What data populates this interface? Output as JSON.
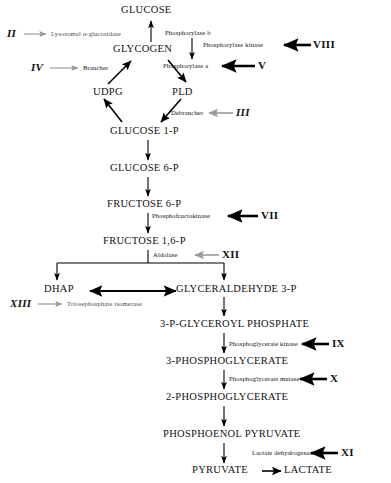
{
  "diagram": {
    "colors": {
      "text": "#111111",
      "arrow_black": "#000000",
      "arrow_gray": "#999999",
      "background": "#ffffff"
    },
    "metabolites": [
      {
        "id": "glucose",
        "label": "GLUCOSE"
      },
      {
        "id": "glycogen",
        "label": "GLYCOGEN"
      },
      {
        "id": "udpg",
        "label": "UDPG"
      },
      {
        "id": "pld",
        "label": "PLD"
      },
      {
        "id": "glucose1p",
        "label": "GLUCOSE 1-P"
      },
      {
        "id": "glucose6p",
        "label": "GLUCOSE 6-P"
      },
      {
        "id": "fructose6p",
        "label": "FRUCTOSE 6-P"
      },
      {
        "id": "fructose16p",
        "label": "FRUCTOSE 1,6-P"
      },
      {
        "id": "dhap",
        "label": "DHAP"
      },
      {
        "id": "g3p",
        "label": "GLYCERALDEHYDE 3-P"
      },
      {
        "id": "bpg",
        "label": "3-P-GLYCEROYL  PHOSPHATE"
      },
      {
        "id": "pg3",
        "label": "3-PHOSPHOGLYCERATE"
      },
      {
        "id": "pg2",
        "label": "2-PHOSPHOGLYCERATE"
      },
      {
        "id": "pep",
        "label": "PHOSPHOENOL  PYRUVATE"
      },
      {
        "id": "pyruvate",
        "label": "PYRUVATE"
      },
      {
        "id": "lactate",
        "label": "LACTATE"
      }
    ],
    "enzymes": [
      {
        "id": "lysosomal-alpha-glucosidase",
        "label": "Lysosomal  α-glucosidase",
        "style": "gray"
      },
      {
        "id": "brancher",
        "label": "Brancher",
        "style": "gray"
      },
      {
        "id": "phosphorylase-b",
        "label": "Phosphorylase b",
        "style": "black"
      },
      {
        "id": "phosphorylase-kinase",
        "label": "Phosphorylase  kinase",
        "style": "black"
      },
      {
        "id": "phosphorylase-a",
        "label": "Phosphorylase a",
        "style": "black"
      },
      {
        "id": "debrancher",
        "label": "Debrancher",
        "style": "gray"
      },
      {
        "id": "phosphofructokinase",
        "label": "Phosphofructokinase",
        "style": "black"
      },
      {
        "id": "aldolase",
        "label": "Aldolase",
        "style": "gray"
      },
      {
        "id": "triosephosphate-isomerase",
        "label": "Triosephosphate  isomerase",
        "style": "gray"
      },
      {
        "id": "phosphoglycerate-kinase",
        "label": "Phosphoglycerate kinase",
        "style": "black"
      },
      {
        "id": "phosphoglycerate-mutase",
        "label": "Phosphoglycerate mutase",
        "style": "black"
      },
      {
        "id": "lactate-dehydrogenase",
        "label": "Lactate  dehydrogenase",
        "style": "black"
      }
    ],
    "type_numerals": [
      {
        "id": "II",
        "label": "II",
        "enzyme": "lysosomal-alpha-glucosidase",
        "arrow": "gray"
      },
      {
        "id": "IV",
        "label": "IV",
        "enzyme": "brancher",
        "arrow": "gray"
      },
      {
        "id": "VIII",
        "label": "VIII",
        "enzyme": "phosphorylase-kinase",
        "arrow": "black"
      },
      {
        "id": "V",
        "label": "V",
        "enzyme": "phosphorylase-a",
        "arrow": "black"
      },
      {
        "id": "III",
        "label": "III",
        "enzyme": "debrancher",
        "arrow": "gray"
      },
      {
        "id": "VII",
        "label": "VII",
        "enzyme": "phosphofructokinase",
        "arrow": "black"
      },
      {
        "id": "XII",
        "label": "XII",
        "enzyme": "aldolase",
        "arrow": "gray"
      },
      {
        "id": "XIII",
        "label": "XIII",
        "enzyme": "triosephosphate-isomerase",
        "arrow": "gray"
      },
      {
        "id": "IX",
        "label": "IX",
        "enzyme": "phosphoglycerate-kinase",
        "arrow": "black"
      },
      {
        "id": "X",
        "label": "X",
        "enzyme": "phosphoglycerate-mutase",
        "arrow": "black"
      },
      {
        "id": "XI",
        "label": "XI",
        "enzyme": "lactate-dehydrogenase",
        "arrow": "black"
      }
    ]
  }
}
